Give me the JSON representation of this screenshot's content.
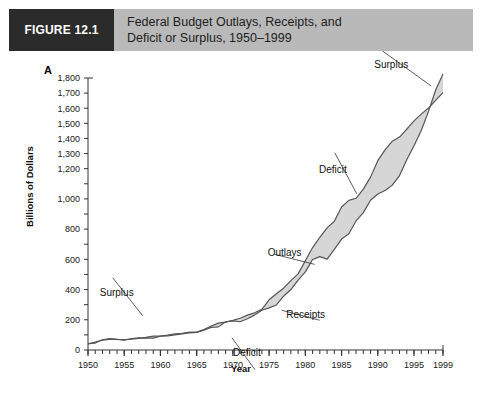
{
  "header": {
    "figure_number": "FIGURE 12.1",
    "title_line1": "Federal Budget Outlays, Receipts, and",
    "title_line2": "Deficit or Surplus, 1950–1999",
    "number_box_color": "#2b2b2b",
    "band_color": "#b9b9b9"
  },
  "panel": {
    "letter": "A"
  },
  "chart_data": {
    "type": "area",
    "title": "Federal Budget Outlays, Receipts, and Deficit or Surplus, 1950–1999",
    "xlabel": "Year",
    "ylabel": "Billions of Dollars",
    "xlim": [
      1950,
      1999
    ],
    "ylim": [
      0,
      1800
    ],
    "grid": false,
    "legend_position": "inline-annotations",
    "ytick_labels": [
      "0",
      "200",
      "400",
      "600",
      "800",
      "1,000",
      "1,200",
      "1,300",
      "1,400",
      "1,500",
      "1,600",
      "1,700",
      "1,800"
    ],
    "ytick_values": [
      0,
      200,
      400,
      600,
      800,
      1000,
      1100,
      1200,
      1300,
      1400,
      1500,
      1600,
      1700,
      1800
    ],
    "ytick_minor_step": 100,
    "xtick_labels": [
      "1950",
      "1955",
      "1960",
      "1965",
      "1970",
      "1975",
      "1980",
      "1985",
      "1990",
      "1995",
      "1999"
    ],
    "xtick_values": [
      1950,
      1955,
      1960,
      1965,
      1970,
      1975,
      1980,
      1985,
      1990,
      1995,
      1999
    ],
    "xtick_minor_step": 1,
    "fill_color": "#d6d6d6",
    "line_color": "#555555",
    "annotations": [
      {
        "label": "Surplus",
        "x": 1957,
        "y": 200,
        "note": "early small surpluses, mid-1950s"
      },
      {
        "label": "Deficit",
        "x": 1970,
        "y": 95,
        "note": "points to gap after 1969 surplus"
      },
      {
        "label": "Receipts",
        "x": 1977,
        "y": 250,
        "note": "lower boundary line"
      },
      {
        "label": "Outlays",
        "x": 1981,
        "y": 580,
        "note": "upper boundary line"
      },
      {
        "label": "Deficit",
        "x": 1986,
        "y": 1000,
        "note": "widest shaded gap, mid-1980s to mid-1990s"
      },
      {
        "label": "Surplus",
        "x": 1996,
        "y": 1720,
        "note": "receipts exceed outlays at end of period"
      }
    ],
    "x": [
      1950,
      1951,
      1952,
      1953,
      1954,
      1955,
      1956,
      1957,
      1958,
      1959,
      1960,
      1961,
      1962,
      1963,
      1964,
      1965,
      1966,
      1967,
      1968,
      1969,
      1970,
      1971,
      1972,
      1973,
      1974,
      1975,
      1976,
      1977,
      1978,
      1979,
      1980,
      1981,
      1982,
      1983,
      1984,
      1985,
      1986,
      1987,
      1988,
      1989,
      1990,
      1991,
      1992,
      1993,
      1994,
      1995,
      1996,
      1997,
      1998,
      1999
    ],
    "series": [
      {
        "name": "Outlays",
        "values": [
          43,
          46,
          68,
          76,
          71,
          68,
          71,
          77,
          83,
          92,
          92,
          98,
          107,
          111,
          119,
          118,
          135,
          158,
          178,
          184,
          196,
          210,
          231,
          246,
          269,
          332,
          372,
          409,
          459,
          504,
          591,
          678,
          746,
          808,
          852,
          946,
          990,
          1004,
          1065,
          1144,
          1253,
          1324,
          1382,
          1409,
          1462,
          1516,
          1561,
          1601,
          1653,
          1703
        ]
      },
      {
        "name": "Receipts",
        "values": [
          39,
          52,
          66,
          70,
          70,
          65,
          75,
          80,
          79,
          79,
          92,
          94,
          100,
          107,
          113,
          117,
          131,
          149,
          153,
          187,
          193,
          187,
          207,
          231,
          263,
          279,
          298,
          356,
          400,
          463,
          517,
          599,
          618,
          601,
          666,
          734,
          769,
          854,
          909,
          991,
          1032,
          1055,
          1091,
          1154,
          1259,
          1352,
          1453,
          1579,
          1722,
          1827
        ]
      }
    ]
  }
}
